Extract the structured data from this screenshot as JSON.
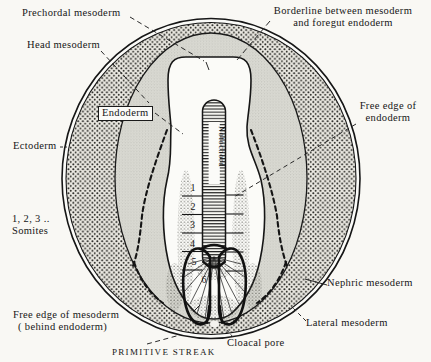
{
  "figure": {
    "colors": {
      "ink": "#1a1a1a",
      "paper": "#f9f8f4",
      "embryo_white": "#fbfbf8",
      "mesoderm_gray": "#dbdbd4",
      "band_background": "#ebe9e2"
    }
  },
  "labels": {
    "prechordal": "Prechordal mesoderm",
    "head_mesoderm": "Head mesoderm",
    "borderline_1": "Borderline between mesoderm",
    "borderline_2": "and foregut endoderm",
    "endoderm": "Endoderm",
    "free_edge_endoderm_1": "Free edge of",
    "free_edge_endoderm_2": "endoderm",
    "ectoderm": "Ectoderm",
    "somites_1": "1, 2, 3 ..",
    "somites_2": "Somites",
    "free_edge_mesoderm_1": "Free edge of mesoderm",
    "free_edge_mesoderm_2": "( behind endoderm)",
    "primitive_streak": "PRIMITIVE STREAK",
    "cloacal_pore": "Cloacal pore",
    "nephric": "Nephric mesoderm",
    "lateral": "Lateral mesoderm",
    "notochord": "Notochord"
  },
  "somite_numbers": [
    "1",
    "2",
    "3",
    "4",
    "5",
    "6"
  ]
}
